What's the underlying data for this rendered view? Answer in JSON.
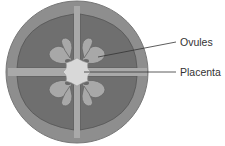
{
  "diagram": {
    "labels": {
      "ovules": "Ovules",
      "placenta": "Placenta"
    },
    "colors": {
      "outer_wall": "#8e8e8e",
      "locule": "#6f6f6f",
      "septum": "#a9a9a9",
      "ovule": "#a8a8a8",
      "placenta": "#d8d8d8",
      "leader_line": "#333333"
    }
  }
}
